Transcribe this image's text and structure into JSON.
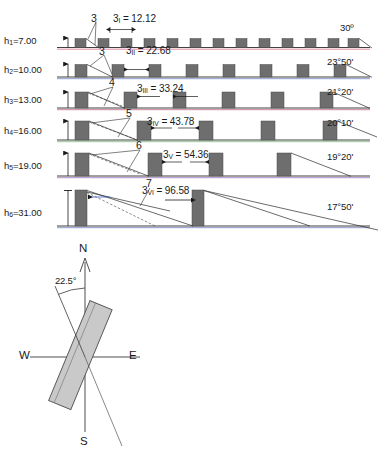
{
  "figure": {
    "type": "technical-diagram"
  },
  "sections": [
    {
      "id": "row-1",
      "height_label": "h",
      "height_sub": "1",
      "height_eq": "=7.00",
      "height_value": 7.0,
      "angle": "30º",
      "spacing_symbol": "3",
      "spacing_sub": "I",
      "spacing_eq": "= 12.12",
      "spacing_value": 12.12,
      "callout": "3",
      "building_count": 13,
      "baseline_color": "#d96b84"
    },
    {
      "id": "row-2",
      "height_label": "h",
      "height_sub": "2",
      "height_eq": "=10.00",
      "height_value": 10.0,
      "angle": "23°50'",
      "spacing_symbol": "3",
      "spacing_sub": "II",
      "spacing_eq": "= 22.68",
      "spacing_value": 22.68,
      "callout": "3",
      "building_count": 8,
      "baseline_color": "#6a7fc0"
    },
    {
      "id": "row-3",
      "height_label": "h",
      "height_sub": "3",
      "height_eq": "=13.00",
      "height_value": 13.0,
      "angle": "21°20'",
      "spacing_symbol": "3",
      "spacing_sub": "III",
      "spacing_eq": "= 33.24",
      "spacing_value": 33.24,
      "callout": "4",
      "building_count": 6,
      "baseline_color": "#c0607c"
    },
    {
      "id": "row-4",
      "height_label": "h",
      "height_sub": "4",
      "height_eq": "=16.00",
      "height_value": 16.0,
      "angle": "20°10'",
      "spacing_symbol": "3",
      "spacing_sub": "IV",
      "spacing_eq": "= 43.78",
      "spacing_value": 43.78,
      "callout": "5",
      "building_count": 5,
      "baseline_color": "#7ab37a"
    },
    {
      "id": "row-5",
      "height_label": "h",
      "height_sub": "5",
      "height_eq": "=19.00",
      "height_value": 19.0,
      "angle": "19°20'",
      "spacing_symbol": "3",
      "spacing_sub": "V",
      "spacing_eq": "= 54.36",
      "spacing_value": 54.36,
      "callout": "6",
      "building_count": 4,
      "baseline_color": "#9b6fbf"
    },
    {
      "id": "row-6",
      "height_label": "h",
      "height_sub": "6",
      "height_eq": "=31.00",
      "height_value": 31.0,
      "angle": "17°50'",
      "spacing_symbol": "3",
      "spacing_sub": "VI",
      "spacing_eq": "= 96.58",
      "spacing_value": 96.58,
      "callout": "7",
      "building_count": 2,
      "baseline_color": "#6a7fc0"
    }
  ],
  "compass": {
    "north": "N",
    "south": "S",
    "east": "E",
    "west": "W",
    "angle_label": "22.5°",
    "angle_value": 22.5,
    "slab_fill": "#c9c9c9",
    "slab_stroke": "#555555"
  },
  "colors": {
    "building_fill": "#6e6e6e",
    "building_stroke": "#4a4a4a",
    "ground_line": "#2b2b2b",
    "ray_line": "#2b2b2b",
    "dim_line": "#1a1a1a",
    "text": "#1a1a1a"
  }
}
